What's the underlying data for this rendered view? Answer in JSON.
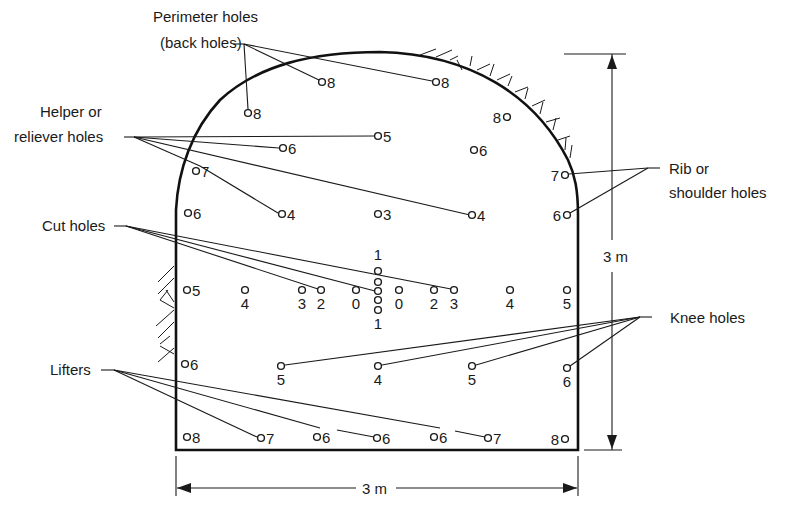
{
  "labels": {
    "perimeter_line1": "Perimeter holes",
    "perimeter_line2": "(back holes)",
    "helper_line1": "Helper or",
    "helper_line2": "reliever holes",
    "cut": "Cut holes",
    "lifters": "Lifters",
    "rib_line1": "Rib or",
    "rib_line2": "shoulder holes",
    "knee": "Knee holes"
  },
  "dimensions": {
    "height": "3 m",
    "width": "3 m"
  },
  "holes": [
    {
      "group": "perimeter",
      "x": 322,
      "y": 82,
      "delay": "8"
    },
    {
      "group": "perimeter",
      "x": 436,
      "y": 82,
      "delay": "8"
    },
    {
      "group": "perimeter",
      "x": 248,
      "y": 113,
      "delay": "8"
    },
    {
      "group": "perimeter",
      "x": 507,
      "y": 117,
      "delay": "8"
    },
    {
      "group": "helper",
      "x": 378,
      "y": 136,
      "delay": "5"
    },
    {
      "group": "helper",
      "x": 283,
      "y": 148,
      "delay": "6"
    },
    {
      "group": "helper",
      "x": 474,
      "y": 150,
      "delay": "6"
    },
    {
      "group": "helper",
      "x": 196,
      "y": 171,
      "delay": "7"
    },
    {
      "group": "helper",
      "x": 282,
      "y": 214,
      "delay": "4"
    },
    {
      "group": "helper",
      "x": 378,
      "y": 214,
      "delay": "3"
    },
    {
      "group": "helper",
      "x": 472,
      "y": 215,
      "delay": "4"
    },
    {
      "group": "rib",
      "x": 565,
      "y": 175,
      "delay": "7"
    },
    {
      "group": "rib",
      "x": 567,
      "y": 215,
      "delay": "6"
    },
    {
      "group": "helper",
      "x": 188,
      "y": 213,
      "delay": "6"
    },
    {
      "group": "helper",
      "x": 187,
      "y": 290,
      "delay": "5"
    },
    {
      "group": "helper",
      "x": 245,
      "y": 290,
      "delay": "4"
    },
    {
      "group": "cut",
      "x": 302,
      "y": 290,
      "delay": "3"
    },
    {
      "group": "cut",
      "x": 321,
      "y": 290,
      "delay": "2"
    },
    {
      "group": "cut",
      "x": 356,
      "y": 290,
      "delay": "0"
    },
    {
      "group": "cut",
      "x": 378,
      "y": 271,
      "delay": "1"
    },
    {
      "group": "cut",
      "x": 378,
      "y": 282,
      "delay": ""
    },
    {
      "group": "cut",
      "x": 378,
      "y": 291,
      "delay": ""
    },
    {
      "group": "cut",
      "x": 378,
      "y": 300,
      "delay": ""
    },
    {
      "group": "cut",
      "x": 378,
      "y": 310,
      "delay": "1"
    },
    {
      "group": "cut",
      "x": 399,
      "y": 290,
      "delay": "0"
    },
    {
      "group": "cut",
      "x": 434,
      "y": 290,
      "delay": "2"
    },
    {
      "group": "cut",
      "x": 454,
      "y": 290,
      "delay": "3"
    },
    {
      "group": "helper",
      "x": 510,
      "y": 290,
      "delay": "4"
    },
    {
      "group": "helper",
      "x": 567,
      "y": 290,
      "delay": "5"
    },
    {
      "group": "knee",
      "x": 185,
      "y": 364,
      "delay": "6"
    },
    {
      "group": "knee",
      "x": 281,
      "y": 366,
      "delay": "5"
    },
    {
      "group": "knee",
      "x": 378,
      "y": 366,
      "delay": "4"
    },
    {
      "group": "knee",
      "x": 472,
      "y": 366,
      "delay": "5"
    },
    {
      "group": "knee",
      "x": 567,
      "y": 368,
      "delay": "6"
    },
    {
      "group": "lifter",
      "x": 187,
      "y": 437,
      "delay": "8"
    },
    {
      "group": "lifter",
      "x": 261,
      "y": 438,
      "delay": "7"
    },
    {
      "group": "lifter",
      "x": 317,
      "y": 437,
      "delay": "6"
    },
    {
      "group": "lifter",
      "x": 377,
      "y": 438,
      "delay": "6"
    },
    {
      "group": "lifter",
      "x": 434,
      "y": 437,
      "delay": "6"
    },
    {
      "group": "lifter",
      "x": 488,
      "y": 438,
      "delay": "7"
    },
    {
      "group": "lifter",
      "x": 565,
      "y": 439,
      "delay": "8"
    }
  ]
}
